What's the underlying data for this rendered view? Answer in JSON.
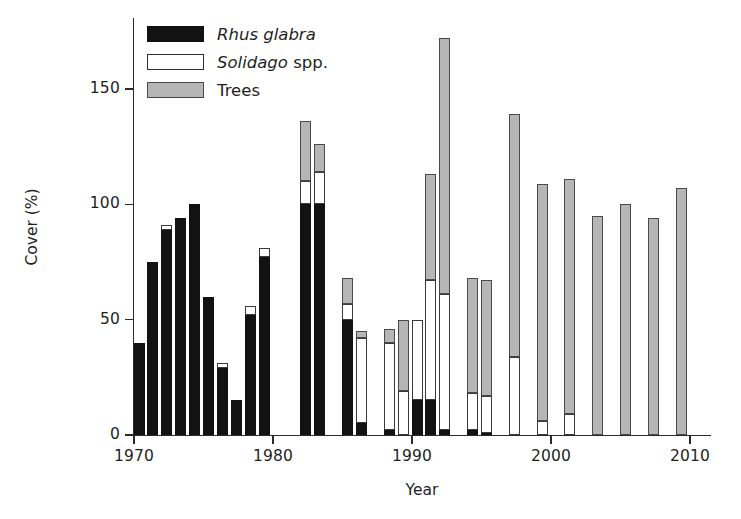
{
  "chart_data": {
    "type": "bar",
    "stacked": true,
    "title": "",
    "xlabel": "Year",
    "ylabel": "Cover (%)",
    "xlim": [
      1969,
      2010.5
    ],
    "ylim": [
      0,
      180
    ],
    "xticks": [
      1970,
      1980,
      1990,
      2000,
      2010
    ],
    "yticks": [
      0,
      50,
      100,
      150
    ],
    "xtick_labels": [
      "1970",
      "1980",
      "1990",
      "2000",
      "2010"
    ],
    "ytick_labels": [
      "0",
      "50",
      "100",
      "150"
    ],
    "grid": false,
    "legend_position": "top-left",
    "series": [
      {
        "name": "Rhus glabra",
        "key": "rhus",
        "color": "#121212",
        "style": "black-fill",
        "categories": [
          1970,
          1971,
          1972,
          1973,
          1974,
          1975,
          1976,
          1977,
          1978,
          1979,
          1980,
          1982,
          1983,
          1985,
          1986,
          1988,
          1989,
          1990,
          1991,
          1992,
          1994,
          1995
        ],
        "values": [
          40,
          75,
          89,
          94,
          100,
          60,
          29,
          15,
          52,
          77,
          100,
          100,
          100,
          50,
          5,
          2,
          0,
          15,
          2,
          0,
          2,
          1
        ]
      },
      {
        "name": "Solidago spp.",
        "key": "solidago",
        "color": "#ffffff",
        "style": "white-fill",
        "categories": [
          1970,
          1971,
          1972,
          1973,
          1974,
          1975,
          1976,
          1977,
          1978,
          1979,
          1980,
          1982,
          1983,
          1985,
          1986,
          1988,
          1989,
          1990,
          1991,
          1992,
          1994,
          1995,
          1997,
          1999,
          2001
        ],
        "values": [
          0,
          0,
          2,
          0,
          0,
          0,
          2,
          0,
          4,
          4,
          0,
          10,
          14,
          7,
          37,
          38,
          19,
          35,
          52,
          59,
          16,
          16,
          34,
          6,
          9
        ]
      },
      {
        "name": "Trees",
        "key": "trees",
        "color": "#b6b6b6",
        "style": "gray-fill",
        "categories": [
          1980,
          1982,
          1983,
          1985,
          1986,
          1988,
          1989,
          1990,
          1991,
          1992,
          1994,
          1995,
          1997,
          1999,
          2001,
          2003,
          2005,
          2007,
          2009
        ],
        "values": [
          0,
          26,
          12,
          11,
          3,
          6,
          31,
          0,
          46,
          111,
          50,
          50,
          105,
          103,
          102,
          95,
          100,
          94,
          107
        ]
      }
    ],
    "bars": [
      {
        "year": 1970,
        "rhus": 40,
        "solidago": 0,
        "trees": 0,
        "total": 40
      },
      {
        "year": 1971,
        "rhus": 75,
        "solidago": 0,
        "trees": 0,
        "total": 75
      },
      {
        "year": 1972,
        "rhus": 89,
        "solidago": 2,
        "trees": 0,
        "total": 91
      },
      {
        "year": 1973,
        "rhus": 94,
        "solidago": 0,
        "trees": 0,
        "total": 94
      },
      {
        "year": 1974,
        "rhus": 100,
        "solidago": 0,
        "trees": 0,
        "total": 100
      },
      {
        "year": 1975,
        "rhus": 60,
        "solidago": 0,
        "trees": 0,
        "total": 60
      },
      {
        "year": 1976,
        "rhus": 29,
        "solidago": 2,
        "trees": 0,
        "total": 31
      },
      {
        "year": 1977,
        "rhus": 15,
        "solidago": 0,
        "trees": 0,
        "total": 15
      },
      {
        "year": 1978,
        "rhus": 52,
        "solidago": 4,
        "trees": 0,
        "total": 56
      },
      {
        "year": 1979,
        "rhus": 77,
        "solidago": 4,
        "trees": 0,
        "total": 81
      },
      {
        "year": 1980,
        "rhus": 0,
        "solidago": 0,
        "trees": 0,
        "total": 0
      },
      {
        "year": 1982,
        "rhus": 100,
        "solidago": 10,
        "trees": 26,
        "total": 136
      },
      {
        "year": 1983,
        "rhus": 100,
        "solidago": 14,
        "trees": 12,
        "total": 126
      },
      {
        "year": 1985,
        "rhus": 50,
        "solidago": 7,
        "trees": 11,
        "total": 68
      },
      {
        "year": 1986,
        "rhus": 5,
        "solidago": 37,
        "trees": 3,
        "total": 45
      },
      {
        "year": 1988,
        "rhus": 2,
        "solidago": 38,
        "trees": 6,
        "total": 46
      },
      {
        "year": 1989,
        "rhus": 0,
        "solidago": 19,
        "trees": 31,
        "total": 50
      },
      {
        "year": 1990,
        "rhus": 15,
        "solidago": 35,
        "trees": 0,
        "total": 50
      },
      {
        "year": 1991,
        "rhus": 15,
        "solidago": 52,
        "trees": 46,
        "total": 113
      },
      {
        "year": 1992,
        "rhus": 2,
        "solidago": 59,
        "trees": 111,
        "total": 172
      },
      {
        "year": 1994,
        "rhus": 2,
        "solidago": 16,
        "trees": 50,
        "total": 68
      },
      {
        "year": 1995,
        "rhus": 1,
        "solidago": 16,
        "trees": 50,
        "total": 67
      },
      {
        "year": 1997,
        "rhus": 0,
        "solidago": 34,
        "trees": 105,
        "total": 139
      },
      {
        "year": 1999,
        "rhus": 0,
        "solidago": 6,
        "trees": 103,
        "total": 139
      },
      {
        "year": 2001,
        "rhus": 0,
        "solidago": 9,
        "trees": 102,
        "total": 139
      },
      {
        "year": 2003,
        "rhus": 0,
        "solidago": 0,
        "trees": 95,
        "total": 95
      },
      {
        "year": 2005,
        "rhus": 0,
        "solidago": 0,
        "trees": 100,
        "total": 100
      },
      {
        "year": 2007,
        "rhus": 0,
        "solidago": 0,
        "trees": 94,
        "total": 94
      },
      {
        "year": 2009,
        "rhus": 0,
        "solidago": 0,
        "trees": 107,
        "total": 107
      }
    ]
  },
  "legend": {
    "entries": [
      {
        "key": "rhus",
        "label_italic": "Rhus glabra",
        "label_plain": "",
        "color": "#121212"
      },
      {
        "key": "solidago",
        "label_italic": "Solidago",
        "label_plain": " spp.",
        "color": "#ffffff"
      },
      {
        "key": "trees",
        "label_italic": "",
        "label_plain": "Trees",
        "color": "#b6b6b6"
      }
    ]
  },
  "axes": {
    "ylabel": "Cover (%)",
    "xlabel": "Year"
  }
}
